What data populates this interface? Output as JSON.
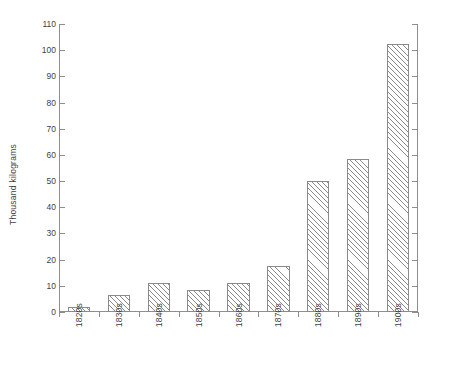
{
  "chart_data": {
    "type": "bar",
    "title": "",
    "subtitle": "",
    "xlabel": "",
    "ylabel": "Thousand kilograms",
    "categories": [
      "1820s",
      "1830s",
      "1840s",
      "1850s",
      "1860s",
      "1870s",
      "1880s",
      "1890s",
      "1900s"
    ],
    "values": [
      2,
      6.5,
      11,
      8.5,
      11,
      17.5,
      50,
      58.5,
      102.5
    ],
    "ylim": [
      0,
      110
    ],
    "ytick_step": 10,
    "ytick_labels": [
      "0",
      "10",
      "20",
      "30",
      "40",
      "50",
      "60",
      "70",
      "80",
      "90",
      "100",
      "110"
    ],
    "ytick_values": [
      0,
      10,
      20,
      30,
      40,
      50,
      60,
      70,
      80,
      90,
      100,
      110
    ],
    "grid": false,
    "legend": null,
    "legend_position": "none",
    "annotations": [],
    "bar_fill": "diagonal-hatch",
    "bar_edge_color": "#8a8a8a",
    "axis_color": "#8e8e8e",
    "background_color": "#ffffff",
    "text_color": "#3f3f3f",
    "ticks_both_sides": true,
    "xtick_labels_rotated_degrees": 90
  }
}
